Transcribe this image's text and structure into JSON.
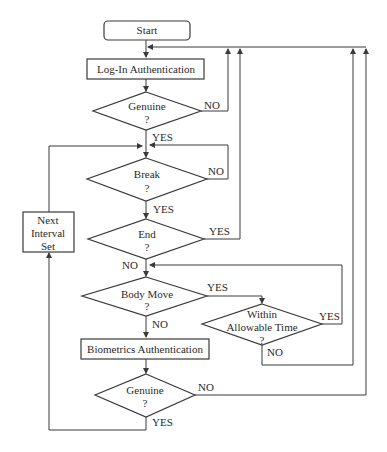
{
  "diagram": {
    "type": "flowchart",
    "nodes": {
      "start": {
        "label": "Start",
        "shape": "terminator"
      },
      "login": {
        "label": "Log-In Authentication",
        "shape": "process"
      },
      "genuine1": {
        "line1": "Genuine",
        "line2": "?",
        "shape": "decision"
      },
      "break": {
        "line1": "Break",
        "line2": "?",
        "shape": "decision"
      },
      "end": {
        "line1": "End",
        "line2": "?",
        "shape": "decision"
      },
      "next_interval": {
        "line1": "Next",
        "line2": "Interval",
        "line3": "Set",
        "shape": "process"
      },
      "body_move": {
        "line1": "Body Move",
        "line2": "?",
        "shape": "decision"
      },
      "within_time": {
        "line1": "Within",
        "line2": "Allowable Time",
        "line3": "?",
        "shape": "decision"
      },
      "biometrics": {
        "label": "Biometrics Authentication",
        "shape": "process"
      },
      "genuine2": {
        "line1": "Genuine",
        "line2": "?",
        "shape": "decision"
      }
    },
    "edge_labels": {
      "genuine1_no": "NO",
      "genuine1_yes": "YES",
      "break_no": "NO",
      "break_yes": "YES",
      "end_yes": "YES",
      "end_no": "NO",
      "body_move_yes": "YES",
      "body_move_no": "NO",
      "within_yes": "YES",
      "within_no": "NO",
      "genuine2_no": "NO",
      "genuine2_yes": "YES"
    },
    "edges": [
      {
        "from": "start",
        "to": "login"
      },
      {
        "from": "login",
        "to": "genuine1"
      },
      {
        "from": "genuine1",
        "to": "login",
        "label": "NO"
      },
      {
        "from": "genuine1",
        "to": "break",
        "label": "YES"
      },
      {
        "from": "break",
        "to": "break",
        "label": "NO"
      },
      {
        "from": "break",
        "to": "end",
        "label": "YES"
      },
      {
        "from": "end",
        "to": "login",
        "label": "YES"
      },
      {
        "from": "end",
        "to": "body_move",
        "label": "NO"
      },
      {
        "from": "body_move",
        "to": "within_time",
        "label": "YES"
      },
      {
        "from": "body_move",
        "to": "biometrics",
        "label": "NO"
      },
      {
        "from": "within_time",
        "to": "body_move",
        "label": "YES"
      },
      {
        "from": "within_time",
        "to": "login",
        "label": "NO"
      },
      {
        "from": "biometrics",
        "to": "genuine2"
      },
      {
        "from": "genuine2",
        "to": "login",
        "label": "NO"
      },
      {
        "from": "genuine2",
        "to": "next_interval",
        "label": "YES"
      },
      {
        "from": "next_interval",
        "to": "break"
      }
    ]
  }
}
